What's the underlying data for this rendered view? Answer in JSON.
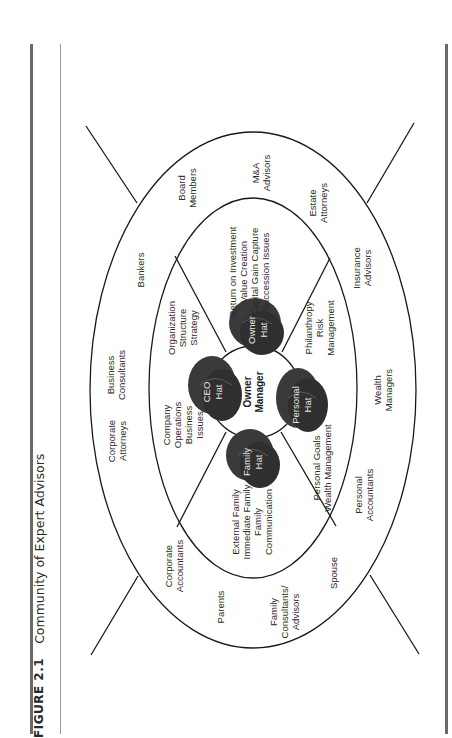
{
  "caption": {
    "figure_number": "FIGURE 2.1",
    "title": "Community of Expert Advisors"
  },
  "diagram": {
    "center": {
      "line1": "Owner",
      "line2": "Manager"
    },
    "hats": [
      {
        "id": "ceo",
        "line1": "CEO",
        "line2": "Hat"
      },
      {
        "id": "owner",
        "line1": "Owner",
        "line2": "Hat"
      },
      {
        "id": "personal",
        "line1": "Personal",
        "line2": "Hat"
      },
      {
        "id": "family",
        "line1": "Family",
        "line2": "Hat"
      }
    ],
    "inner_ring": {
      "ceo_left": [
        "Company",
        "Operations",
        "Business",
        "Issues"
      ],
      "ceo_right": [
        "Organization",
        "Structure",
        "Strategy"
      ],
      "owner": [
        "Return on Investment",
        "Value Creation",
        "Capital Gain Capture",
        "Succession Issues"
      ],
      "personal_top": [
        "Philanthropy",
        "Risk",
        "Management"
      ],
      "personal_bottom": [
        "Personal Goals",
        "Wealth Management"
      ],
      "family": [
        "External Family",
        "Immediate Family",
        "Family",
        "Communication"
      ]
    },
    "outer_ring": {
      "bankers": [
        "Bankers"
      ],
      "business_consultants": [
        "Business",
        "Consultants"
      ],
      "corporate_attorneys": [
        "Corporate",
        "Attorneys"
      ],
      "board_members": [
        "Board",
        "Members"
      ],
      "ma_advisors": [
        "M&A",
        "Advisors"
      ],
      "estate_attorneys": [
        "Estate",
        "Attorneys"
      ],
      "insurance_advisors": [
        "Insurance",
        "Advisors"
      ],
      "wealth_managers": [
        "Wealth",
        "Managers"
      ],
      "personal_accountants": [
        "Personal",
        "Accountants"
      ],
      "spouse": [
        "Spouse"
      ],
      "family_consultants": [
        "Family",
        "Consultants/",
        "Advisors"
      ],
      "parents": [
        "Parents"
      ],
      "corporate_accountants": [
        "Corporate",
        "Accountants"
      ]
    },
    "colors": {
      "hat_fill": "#3c3c3c",
      "line": "#1a1a1a"
    }
  }
}
